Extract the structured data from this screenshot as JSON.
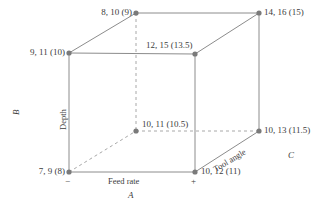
{
  "figure": {
    "type": "factorial-design-cube",
    "style": {
      "line_color": "#8c8c8c",
      "node_color": "#7a7a7a",
      "text_color": "#3c3c3c",
      "background": "#ffffff"
    }
  },
  "axes": [
    {
      "id": "A",
      "name": "A",
      "edge_label": "Feed rate",
      "low_sign": "−",
      "high_sign": "+"
    },
    {
      "id": "B",
      "name": "B",
      "edge_label": "Depth",
      "low_sign": "",
      "high_sign": ""
    },
    {
      "id": "C",
      "name": "C",
      "edge_label": "Tool angle",
      "low_sign": "",
      "high_sign": ""
    }
  ],
  "vertices": [
    {
      "id": "v-back-top-left",
      "label": "8, 10 (9)",
      "replicates": [
        8,
        10
      ],
      "mean": 9,
      "x": 136,
      "y": 13,
      "hidden": false
    },
    {
      "id": "v-back-top-right",
      "label": "14, 16 (15)",
      "replicates": [
        14,
        16
      ],
      "mean": 15,
      "x": 259,
      "y": 13,
      "hidden": false
    },
    {
      "id": "v-front-top-left",
      "label": "9, 11 (10)",
      "replicates": [
        9,
        11
      ],
      "mean": 10,
      "x": 69,
      "y": 53,
      "hidden": false
    },
    {
      "id": "v-front-top-right",
      "label": "12, 15 (13.5)",
      "replicates": [
        12,
        15
      ],
      "mean": 13.5,
      "x": 195,
      "y": 54,
      "hidden": false
    },
    {
      "id": "v-back-bottom-left",
      "label": "10, 11 (10.5)",
      "replicates": [
        10,
        11
      ],
      "mean": 10.5,
      "x": 136,
      "y": 131,
      "hidden": true
    },
    {
      "id": "v-back-bottom-right",
      "label": "10, 13 (11.5)",
      "replicates": [
        10,
        13
      ],
      "mean": 11.5,
      "x": 259,
      "y": 131,
      "hidden": false
    },
    {
      "id": "v-front-bottom-left",
      "label": "7, 9 (8)",
      "replicates": [
        7,
        9
      ],
      "mean": 8,
      "x": 69,
      "y": 172,
      "hidden": false
    },
    {
      "id": "v-front-bottom-right",
      "label": "10, 12 (11)",
      "replicates": [
        10,
        12
      ],
      "mean": 11,
      "x": 195,
      "y": 172,
      "hidden": false
    }
  ],
  "labels": {
    "back_top_left": "8, 10 (9)",
    "back_top_right": "14, 16 (15)",
    "front_top_left": "9, 11 (10)",
    "front_top_right": "12, 15 (13.5)",
    "back_bottom_left": "10, 11 (10.5)",
    "back_bottom_right": "10, 13 (11.5)",
    "front_bottom_left": "7, 9 (8)",
    "front_bottom_right": "10, 12 (11)",
    "axis_a": "A",
    "axis_b": "B",
    "axis_c": "C",
    "edge_a": "Feed rate",
    "edge_b": "Depth",
    "edge_c": "Tool angle",
    "sign_minus": "−",
    "sign_plus": "+"
  }
}
